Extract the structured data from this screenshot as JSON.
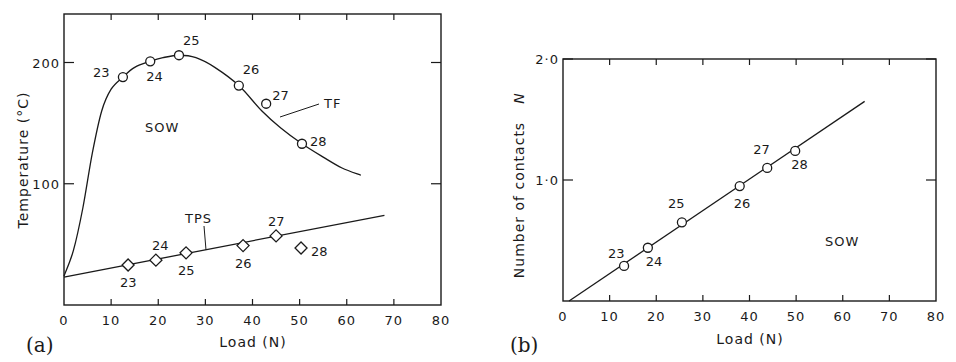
{
  "chart_data": [
    {
      "panel": "(a)",
      "type": "line",
      "title": "",
      "xlabel": "Load (N)",
      "ylabel": "Temperature (°C)",
      "xlim": [
        0,
        80
      ],
      "ylim": [
        0,
        240
      ],
      "xticks": [
        0,
        10,
        20,
        30,
        40,
        50,
        60,
        70,
        80
      ],
      "yticks": [
        100,
        200
      ],
      "ytick_labels": [
        "100",
        "200"
      ],
      "grid": false,
      "annotations": [
        "SOW",
        "TF",
        "TPS"
      ],
      "series": [
        {
          "name": "TF",
          "marker": "circle",
          "points": [
            {
              "label": "23",
              "x": 12.5,
              "y": 188
            },
            {
              "label": "24",
              "x": 18.3,
              "y": 201
            },
            {
              "label": "25",
              "x": 24.4,
              "y": 206
            },
            {
              "label": "26",
              "x": 37.1,
              "y": 181
            },
            {
              "label": "27",
              "x": 42.9,
              "y": 166
            },
            {
              "label": "28",
              "x": 50.5,
              "y": 133
            }
          ],
          "fit_curve": [
            [
              0,
              24
            ],
            [
              2,
              45
            ],
            [
              4,
              80
            ],
            [
              6,
              125
            ],
            [
              8,
              160
            ],
            [
              10,
              178
            ],
            [
              12.5,
              188
            ],
            [
              15,
              196
            ],
            [
              18.3,
              201
            ],
            [
              21,
              204
            ],
            [
              24.4,
              206
            ],
            [
              28,
              204
            ],
            [
              32,
              196
            ],
            [
              37.1,
              181
            ],
            [
              42,
              160
            ],
            [
              46,
              146
            ],
            [
              50.5,
              133
            ],
            [
              55,
              122
            ],
            [
              59,
              113
            ],
            [
              63,
              107
            ]
          ]
        },
        {
          "name": "TPS",
          "marker": "diamond",
          "points": [
            {
              "label": "23",
              "x": 13.6,
              "y": 33
            },
            {
              "label": "24",
              "x": 19.5,
              "y": 37
            },
            {
              "label": "25",
              "x": 25.9,
              "y": 43
            },
            {
              "label": "26",
              "x": 38.0,
              "y": 49
            },
            {
              "label": "27",
              "x": 45.0,
              "y": 57
            },
            {
              "label": "28",
              "x": 50.3,
              "y": 47
            }
          ],
          "fit_curve": [
            [
              0,
              23
            ],
            [
              68,
              74
            ]
          ]
        }
      ]
    },
    {
      "panel": "(b)",
      "type": "scatter",
      "title": "",
      "xlabel": "Load (N)",
      "ylabel": "Number of contacts N",
      "xlim": [
        0,
        80
      ],
      "ylim": [
        0,
        2.0
      ],
      "xticks": [
        0,
        10,
        20,
        30,
        40,
        50,
        60,
        70,
        80
      ],
      "yticks": [
        1.0,
        2.0
      ],
      "ytick_labels": [
        "1·0",
        "2·0"
      ],
      "grid": false,
      "annotations": [
        "SOW"
      ],
      "series": [
        {
          "name": "Number of contacts",
          "marker": "circle",
          "points": [
            {
              "label": "23",
              "x": 13.1,
              "y": 0.29
            },
            {
              "label": "24",
              "x": 18.2,
              "y": 0.44
            },
            {
              "label": "25",
              "x": 25.5,
              "y": 0.65
            },
            {
              "label": "26",
              "x": 37.9,
              "y": 0.95
            },
            {
              "label": "27",
              "x": 43.8,
              "y": 1.1
            },
            {
              "label": "28",
              "x": 49.8,
              "y": 1.24
            }
          ],
          "fit_curve": [
            [
              1.3,
              0.0
            ],
            [
              64.7,
              1.65
            ]
          ]
        }
      ]
    }
  ],
  "panels": {
    "a": {
      "label": "(a)",
      "xlabel": "Load (N)",
      "ylabel": "Temperature (°C)",
      "sow": "SOW",
      "tf": "TF",
      "tps": "TPS"
    },
    "b": {
      "label": "(b)",
      "xlabel": "Load (N)",
      "ylabel_text": "Number of contacts",
      "ylabel_symbol": "N",
      "sow": "SOW"
    }
  },
  "colors": {
    "ink": "#1a1a1a",
    "background": "#ffffff"
  }
}
